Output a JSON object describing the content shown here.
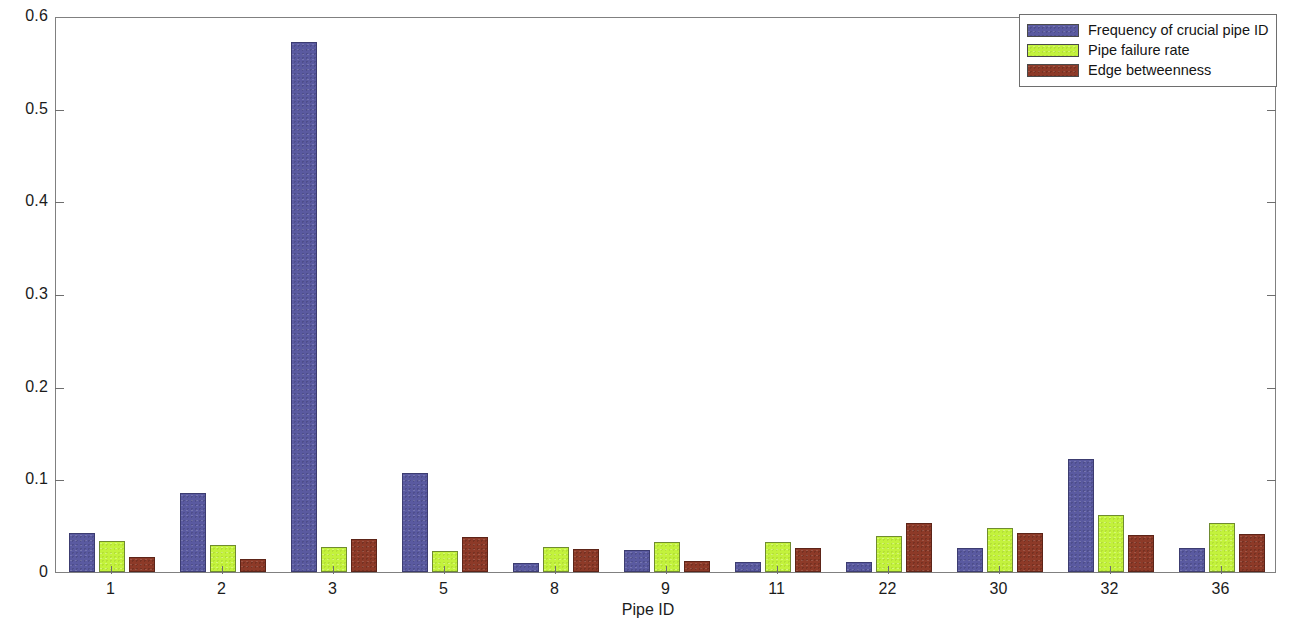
{
  "chart_data": {
    "type": "bar",
    "title": "",
    "xlabel": "Pipe ID",
    "ylabel": "",
    "categories": [
      "1",
      "2",
      "3",
      "5",
      "8",
      "9",
      "11",
      "22",
      "30",
      "32",
      "36"
    ],
    "series": [
      {
        "name": "Frequency of crucial pipe ID",
        "color": "#5a5aa0",
        "values": [
          0.042,
          0.085,
          0.572,
          0.107,
          0.01,
          0.024,
          0.011,
          0.011,
          0.026,
          0.122,
          0.026
        ]
      },
      {
        "name": "Pipe failure rate",
        "color": "#c3f23c",
        "values": [
          0.034,
          0.029,
          0.027,
          0.023,
          0.027,
          0.032,
          0.032,
          0.039,
          0.048,
          0.062,
          0.053
        ]
      },
      {
        "name": "Edge betweenness",
        "color": "#8d3a28",
        "values": [
          0.016,
          0.014,
          0.036,
          0.038,
          0.025,
          0.012,
          0.026,
          0.053,
          0.042,
          0.04,
          0.041
        ]
      }
    ],
    "ylim": [
      0,
      0.6
    ],
    "ytick_values": [
      0,
      0.1,
      0.2,
      0.3,
      0.4,
      0.5,
      0.6
    ],
    "ytick_labels": [
      "0",
      "0.1",
      "0.2",
      "0.3",
      "0.4",
      "0.5",
      "0.6"
    ],
    "grid": false,
    "legend_position": "top-right",
    "axis_box": true
  },
  "legend": {
    "entries": [
      "Frequency of crucial pipe ID",
      "Pipe failure rate",
      "Edge betweenness"
    ]
  }
}
